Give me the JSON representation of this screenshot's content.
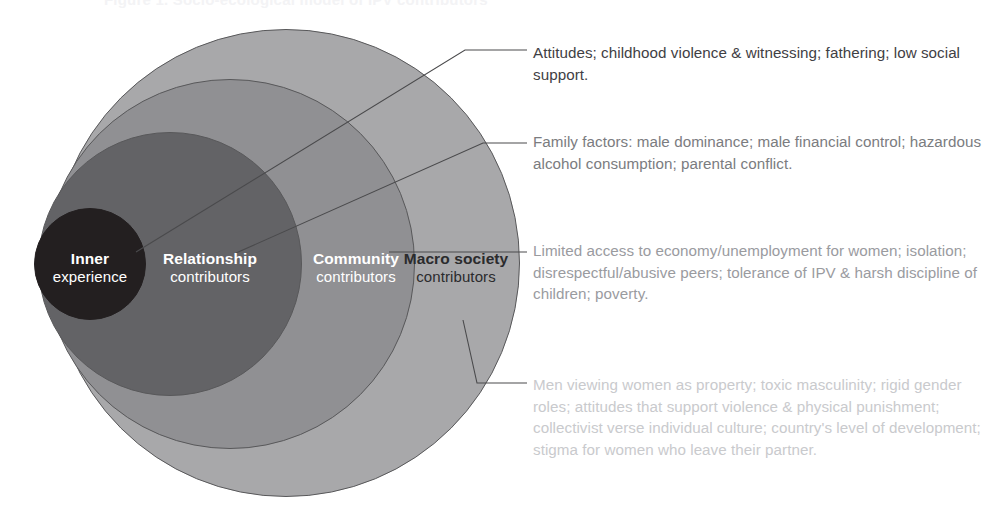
{
  "figure": {
    "type": "nested-circles-socioecological-model",
    "ghost_title": "Figure 1. Socio-ecological model of IPV contributors",
    "background_color": "#ffffff"
  },
  "circles": [
    {
      "key": "inner",
      "title": "Inner",
      "subtitle": "experience",
      "fill": "#231f20",
      "text_color": "#ffffff",
      "level": 1
    },
    {
      "key": "relationship",
      "title": "Relationship",
      "subtitle": "contributors",
      "fill": "#636366",
      "text_color": "#ffffff",
      "level": 2
    },
    {
      "key": "community",
      "title": "Community",
      "subtitle": "contributors",
      "fill": "#909093",
      "text_color": "#ffffff",
      "level": 3
    },
    {
      "key": "macro",
      "title": "Macro society",
      "subtitle": "contributors",
      "fill": "#a8a8aa",
      "text_color": "#2b2b2d",
      "level": 4
    }
  ],
  "annotations": [
    {
      "key": "inner-note",
      "for_circle": "inner",
      "text": "Attitudes; childhood violence & witnessing; fathering; low social support.",
      "color": "#3f4044"
    },
    {
      "key": "relationship-note",
      "for_circle": "relationship",
      "text": "Family factors: male dominance; male financial control; hazardous alcohol consumption; parental conflict.",
      "color": "#7b7c80"
    },
    {
      "key": "community-note",
      "for_circle": "community",
      "text": "Limited access to economy/unemployment for women; isolation; disrespectful/abusive peers; tolerance of IPV & harsh discipline of children; poverty.",
      "color": "#9a9b9f"
    },
    {
      "key": "macro-note",
      "for_circle": "macro",
      "text": "Men viewing women as property; toxic masculinity; rigid gender roles; attitudes that support violence & physical punishment; collectivist verse individual culture; country's level of development; stigma for women who leave their partner.",
      "color": "#c9cacd"
    }
  ],
  "leader_lines": {
    "stroke": "#4a4a4c",
    "stroke_width": 1.1
  }
}
